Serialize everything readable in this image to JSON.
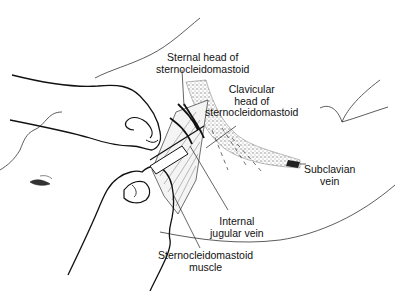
{
  "figure": {
    "ink_color": "#1a1a1a",
    "vein_shade_color": "#8a8a8a"
  },
  "labels": {
    "sternal_head": [
      "Sternal head of",
      "sternocleidomastoid"
    ],
    "clavicular_head": [
      "Clavicular",
      "head of",
      "sternocleidomastoid"
    ],
    "subclavian_vein": [
      "Subclavian",
      "vein"
    ],
    "internal_jugular_vein": [
      "Internal",
      "jugular vein"
    ],
    "scm_muscle": [
      "Sternocleidomastoid",
      "muscle"
    ]
  },
  "parts": [
    "left-hand-palpating",
    "right-hand-syringe",
    "needle",
    "sternal-head",
    "clavicular-head",
    "subclavian-vein",
    "internal-jugular-vein",
    "clavicle-outline",
    "patient-face",
    "shoulder-outline"
  ]
}
